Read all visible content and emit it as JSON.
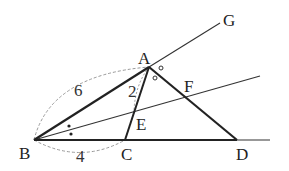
{
  "figure": {
    "points": {
      "A": {
        "label": "A",
        "x": 149,
        "y": 67
      },
      "B": {
        "label": "B",
        "x": 34,
        "y": 140
      },
      "C": {
        "label": "C",
        "x": 125,
        "y": 140
      },
      "D": {
        "label": "D",
        "x": 237,
        "y": 140
      },
      "E": {
        "label": "E",
        "x": 134,
        "y": 111
      },
      "F": {
        "label": "F",
        "x": 185,
        "y": 97
      },
      "G": {
        "label": "G",
        "x": 220,
        "y": 23
      }
    },
    "measurements": {
      "AB": "6",
      "BC": "4",
      "AE": "2"
    },
    "angle_marks": {
      "B_bisector": "dots",
      "A_exterior": "circles"
    },
    "colors": {
      "thick_line": "#222222",
      "thin_line": "#333333",
      "dashed_arc": "#888888"
    }
  }
}
